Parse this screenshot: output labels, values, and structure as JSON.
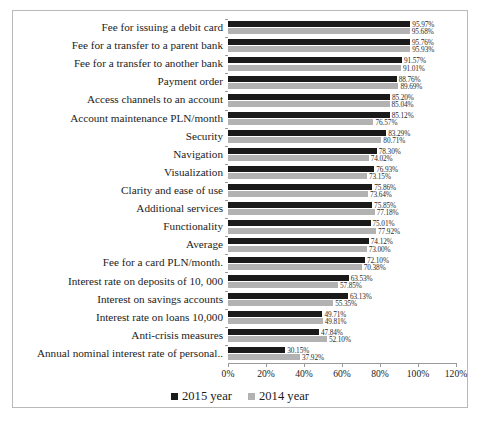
{
  "chart_data": {
    "type": "bar",
    "orientation": "horizontal",
    "title": "",
    "xlabel": "",
    "ylabel": "",
    "xlim": [
      0,
      120
    ],
    "xtick_labels": [
      "0%",
      "20%",
      "40%",
      "60%",
      "80%",
      "100%",
      "120%"
    ],
    "xticks": [
      0,
      20,
      40,
      60,
      80,
      100,
      120
    ],
    "grid": false,
    "legend_position": "bottom",
    "value_suffix": "%",
    "categories": [
      "Fee for issuing a debit card",
      "Fee for a transfer to a parent bank",
      "Fee for a transfer to another bank",
      "Payment order",
      "Access channels to an account",
      "Account maintenance PLN/month",
      "Security",
      "Navigation",
      "Visualization",
      "Clarity and ease of use",
      "Additional services",
      "Functionality",
      "Average",
      "Fee for a card PLN/month.",
      "Interest rate on deposits of 10, 000",
      "Interest on savings accounts",
      "Interest rate on loans 10,000",
      "Anti-crisis measures",
      "Annual nominal interest rate of personal.."
    ],
    "series": [
      {
        "name": "2015 year",
        "color": "#1a1a1a",
        "values": [
          95.97,
          95.76,
          91.57,
          88.76,
          85.2,
          85.12,
          83.29,
          78.3,
          76.93,
          75.86,
          75.85,
          75.01,
          74.12,
          72.1,
          63.53,
          63.13,
          49.71,
          47.84,
          30.15
        ],
        "labels": [
          "95.97%",
          "95.76%",
          "91.57%",
          "88.76%",
          "85.20%",
          "85.12%",
          "83.29%",
          "78.30%",
          "76.93%",
          "75.86%",
          "75.85%",
          "75.01%",
          "74.12%",
          "72.10%",
          "63.53%",
          "63.13%",
          "49.71%",
          "47.84%",
          "30.15%"
        ]
      },
      {
        "name": "2014 year",
        "color": "#b2b2b2",
        "values": [
          95.68,
          95.93,
          91.01,
          89.69,
          85.04,
          76.57,
          80.71,
          74.02,
          73.15,
          73.64,
          77.18,
          77.92,
          73.0,
          70.38,
          57.85,
          55.35,
          49.81,
          52.1,
          37.92
        ],
        "labels": [
          "95.68%",
          "95.93%",
          "91.01%",
          "89.69%",
          "85.04%",
          "76.57%",
          "80.71%",
          "74.02%",
          "73.15%",
          "73.64%",
          "77.18%",
          "77.92%",
          "73.00%",
          "70.38%",
          "57.85%",
          "55.35%",
          "49.81%",
          "52.10%",
          "37.92%"
        ]
      }
    ]
  },
  "legend": {
    "items": [
      {
        "label": "2015 year",
        "color": "#1a1a1a"
      },
      {
        "label": "2014 year",
        "color": "#b2b2b2"
      }
    ]
  }
}
